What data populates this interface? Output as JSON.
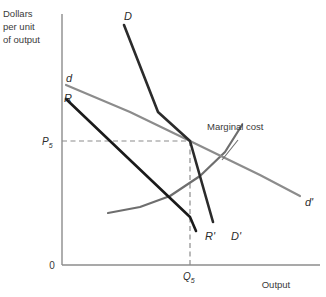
{
  "figure": {
    "kind": "economics-kinked-demand-diagram",
    "background": "#ffffff"
  },
  "axes": {
    "y_title_line1": "Dollars",
    "y_title_line2": "per unit",
    "y_title_line3": "of output",
    "x_title": "Output",
    "origin_label": "0",
    "axis_color": "#8c8c8c",
    "x_axis": {
      "x_start": 62,
      "x_end": 320,
      "y": 265
    },
    "y_axis": {
      "x": 62,
      "y_start": 14,
      "y_end": 265
    }
  },
  "ticks": {
    "price_label": "P",
    "price_subscript": "5",
    "quantity_label": "Q",
    "quantity_subscript": "5",
    "price_level_y": 141,
    "quantity_level_x": 190,
    "guide_color": "#8c8c8c"
  },
  "chart_data": {
    "type": "line",
    "title": "",
    "xlabel": "Output",
    "ylabel": "Dollars per unit of output",
    "grid": false,
    "legend": "inline-curve-labels",
    "xlim": [
      0,
      100
    ],
    "ylim": [
      0,
      100
    ],
    "equilibrium": {
      "label": "kink point",
      "price_tick": "P5",
      "quantity_tick": "Q5",
      "pixel_x": 190,
      "pixel_y": 141
    },
    "series": [
      {
        "name": "D",
        "label": "D",
        "label_end": "D'",
        "description": "steep market demand curve through the kink",
        "color": "#2b2b2b",
        "width": 2.6,
        "points": [
          [
            124,
            25
          ],
          [
            158,
            112
          ],
          [
            190,
            141
          ],
          [
            213,
            222
          ]
        ]
      },
      {
        "name": "d",
        "label": "d",
        "label_end": "d'",
        "description": "flat firm demand curve through the kink",
        "color": "#8c8c8c",
        "width": 2.2,
        "points": [
          [
            66,
            85
          ],
          [
            130,
            112
          ],
          [
            190,
            141
          ],
          [
            260,
            175
          ],
          [
            300,
            196
          ]
        ]
      },
      {
        "name": "R",
        "label": "R",
        "label_end": "R'",
        "description": "marginal revenue line associated with d",
        "color": "#1a1a1a",
        "width": 2.6,
        "points": [
          [
            66,
            99
          ],
          [
            130,
            160
          ],
          [
            190,
            217
          ],
          [
            196,
            231
          ]
        ]
      },
      {
        "name": "MC",
        "label": "Marginal cost",
        "description": "upward sloping marginal cost curve",
        "color": "#6e6e6e",
        "width": 2.2,
        "points": [
          [
            108,
            213
          ],
          [
            140,
            207
          ],
          [
            170,
            196
          ],
          [
            200,
            176
          ],
          [
            225,
            152
          ],
          [
            242,
            125
          ]
        ]
      }
    ],
    "curve_labels": [
      {
        "text": "D",
        "x": 124,
        "y": 20
      },
      {
        "text": "d",
        "x": 66,
        "y": 82
      },
      {
        "text": "R",
        "x": 64,
        "y": 102
      },
      {
        "text": "R'",
        "x": 205,
        "y": 240
      },
      {
        "text": "D'",
        "x": 231,
        "y": 240
      },
      {
        "text": "d'",
        "x": 305,
        "y": 206
      }
    ],
    "annotations": [
      {
        "text": "Marginal cost",
        "x": 207,
        "y": 130,
        "leader_from": [
          238,
          140
        ],
        "leader_to": [
          222,
          160
        ]
      }
    ]
  }
}
